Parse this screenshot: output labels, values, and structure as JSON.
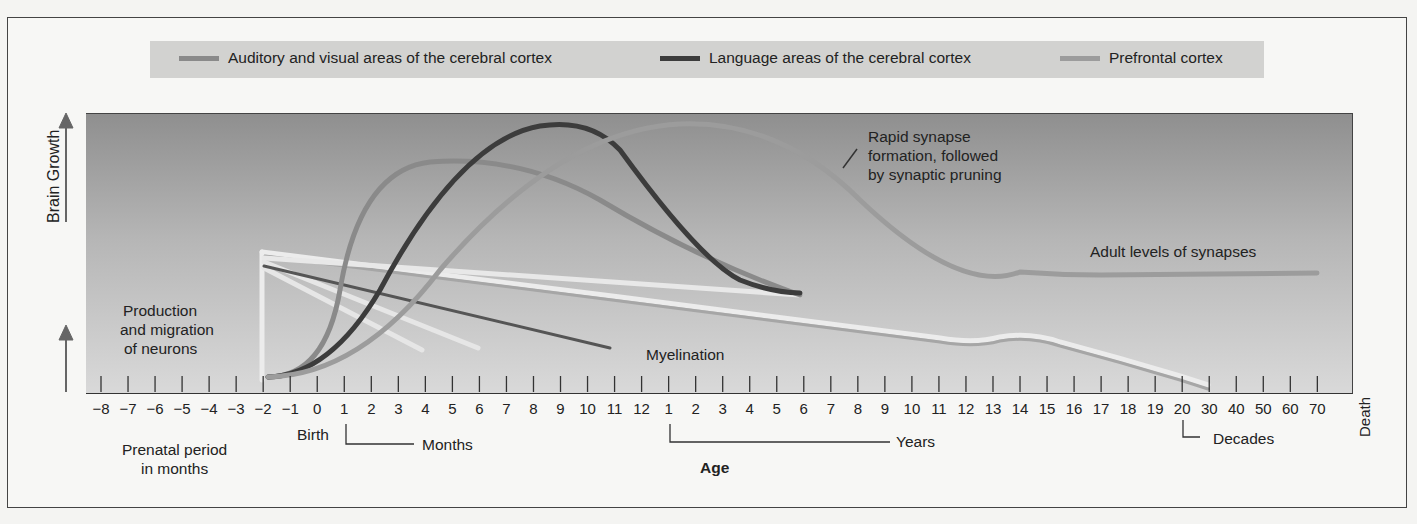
{
  "chart_data": {
    "type": "line",
    "title": "",
    "xlabel": "Age",
    "ylabel": "Brain Growth",
    "legend": [
      {
        "name": "Auditory and visual areas of the cerebral cortex",
        "color": "#8a8a8a"
      },
      {
        "name": "Language areas of the cerebral cortex",
        "color": "#3c3c3c"
      },
      {
        "name": "Prefrontal cortex",
        "color": "#9a9a9a"
      }
    ],
    "legend_position": "top",
    "grid": false,
    "x_ticks": [
      "-8",
      "-7",
      "-6",
      "-5",
      "-4",
      "-3",
      "-2",
      "-1",
      "0",
      "1",
      "2",
      "3",
      "4",
      "5",
      "6",
      "7",
      "8",
      "9",
      "10",
      "11",
      "12",
      "1",
      "2",
      "3",
      "4",
      "5",
      "6",
      "7",
      "8",
      "9",
      "10",
      "11",
      "12",
      "13",
      "14",
      "15",
      "16",
      "17",
      "18",
      "19",
      "20",
      "30",
      "40",
      "50",
      "60",
      "70"
    ],
    "x_segments": [
      {
        "label": "Prenatal period in months",
        "range": [
          "-8",
          "0"
        ]
      },
      {
        "label": "Months",
        "range": [
          "1",
          "12"
        ]
      },
      {
        "label": "Years",
        "range": [
          "1",
          "20"
        ]
      },
      {
        "label": "Decades",
        "range": [
          "20",
          "70"
        ]
      }
    ],
    "series": [
      {
        "name": "Auditory and visual areas of the cerebral cortex",
        "description": "rises sharply after birth, peaks ~4-5 months, declines to ~age 6 years",
        "peak_x": "5 months"
      },
      {
        "name": "Language areas of the cerebral cortex",
        "description": "rises from birth, peaks ~8-9 months, declines to ~age 6 years",
        "peak_x": "9 months"
      },
      {
        "name": "Prefrontal cortex",
        "description": "slow rise, peaks ~2-3 years, declines through adolescence to adult level ~age 15, flat to 70",
        "peak_x": "2-3 years"
      }
    ],
    "annotations": [
      "Production and migration of neurons",
      "Rapid synapse formation, followed by synaptic pruning",
      "Adult levels of synapses",
      "Myelination",
      "Birth",
      "Death"
    ]
  },
  "legend": {
    "item1": "Auditory and visual areas of the cerebral cortex",
    "item2": "Language areas of the cerebral cortex",
    "item3": "Prefrontal cortex"
  },
  "axis": {
    "y_label": "Brain Growth",
    "x_label": "Age",
    "death": "Death",
    "birth": "Birth",
    "prenatal_line1": "Prenatal period",
    "prenatal_line2": "in months",
    "months": "Months",
    "years": "Years",
    "decades": "Decades"
  },
  "annotations": {
    "neurons_line1": "Production",
    "neurons_line2": "and migration",
    "neurons_line3": "of neurons",
    "synapse_line1": "Rapid synapse",
    "synapse_line2": "formation, followed",
    "synapse_line3": "by synaptic pruning",
    "adult": "Adult levels of synapses",
    "myelination": "Myelination"
  },
  "colors": {
    "auditory": "#8a8a8a",
    "language": "#3c3c3c",
    "prefrontal": "#9c9c9c",
    "myelin": "#eeeeee"
  }
}
